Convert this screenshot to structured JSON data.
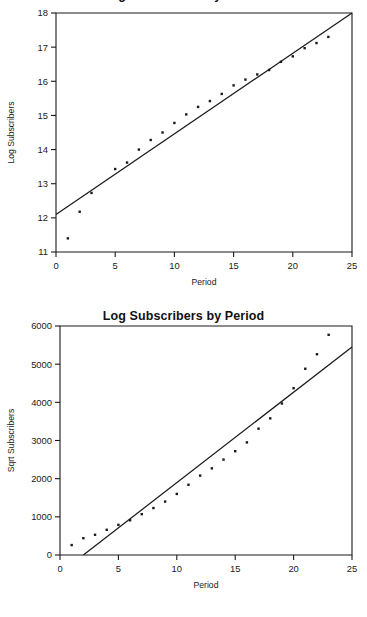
{
  "page": {
    "background": "#ffffff",
    "ink": "#1a1a1a",
    "width": 367,
    "height": 617
  },
  "charts": [
    {
      "id": "chart-1",
      "title": "Log Subscribers by Period",
      "title_clipped": true,
      "xlabel": "Period",
      "ylabel": "Log Subscribers",
      "xticks": [
        0,
        5,
        10,
        15,
        20,
        25
      ],
      "yticks": [
        11,
        12,
        13,
        14,
        15,
        16,
        17,
        18
      ],
      "xlim": [
        0,
        25
      ],
      "ylim": [
        11,
        18
      ],
      "grid": false,
      "legend": "none",
      "fit_line": {
        "intercept": 12.1,
        "slope": 0.236
      }
    },
    {
      "id": "chart-2",
      "title": "Log Subscribers by Period",
      "title_clipped": false,
      "xlabel": "Period",
      "ylabel": "Sqrt Subscribers",
      "xticks": [
        0,
        5,
        10,
        15,
        20,
        25
      ],
      "yticks": [
        0,
        1000,
        2000,
        3000,
        4000,
        5000,
        6000
      ],
      "xlim": [
        0,
        25
      ],
      "ylim": [
        0,
        6000
      ],
      "grid": false,
      "legend": "none",
      "fit_line": {
        "intercept": -470,
        "slope": 237
      }
    }
  ],
  "chart_data": [
    {
      "type": "scatter",
      "title": "Log Subscribers by Period",
      "subtitle": "",
      "xlabel": "Period",
      "ylabel": "Log Subscribers",
      "xlim": [
        0,
        25
      ],
      "ylim": [
        11,
        18
      ],
      "xticks": [
        0,
        5,
        10,
        15,
        20,
        25
      ],
      "yticks": [
        11,
        12,
        13,
        14,
        15,
        16,
        17,
        18
      ],
      "grid": false,
      "legend_position": "none",
      "annotations": [
        "fitted regression line through the scatter"
      ],
      "series": [
        {
          "name": "Log Subscribers",
          "marker": "small square dot",
          "x": [
            1,
            2,
            3,
            5,
            6,
            7,
            8,
            9,
            10,
            11,
            12,
            13,
            14,
            15,
            16,
            17,
            18,
            19,
            20,
            21,
            22,
            23
          ],
          "y": [
            11.4,
            12.18,
            12.73,
            13.43,
            13.62,
            14.0,
            14.28,
            14.5,
            14.78,
            15.03,
            15.25,
            15.42,
            15.63,
            15.88,
            16.05,
            16.2,
            16.33,
            16.57,
            16.73,
            16.97,
            17.12,
            17.3
          ]
        },
        {
          "name": "Fitted line",
          "type": "line",
          "x": [
            0,
            25
          ],
          "y": [
            12.1,
            18.0
          ]
        }
      ]
    },
    {
      "type": "scatter",
      "title": "Log Subscribers by Period",
      "subtitle": "",
      "xlabel": "Period",
      "ylabel": "Sqrt Subscribers",
      "xlim": [
        0,
        25
      ],
      "ylim": [
        0,
        6000
      ],
      "xticks": [
        0,
        5,
        10,
        15,
        20,
        25
      ],
      "yticks": [
        0,
        1000,
        2000,
        3000,
        4000,
        5000,
        6000
      ],
      "grid": false,
      "legend_position": "none",
      "annotations": [
        "fitted regression line through the scatter"
      ],
      "series": [
        {
          "name": "Sqrt Subscribers",
          "marker": "small square dot",
          "x": [
            1,
            2,
            3,
            4,
            5,
            6,
            7,
            8,
            9,
            10,
            11,
            12,
            13,
            14,
            15,
            16,
            17,
            18,
            19,
            20,
            21,
            22,
            23
          ],
          "y": [
            260,
            440,
            530,
            660,
            790,
            910,
            1070,
            1230,
            1400,
            1600,
            1840,
            2080,
            2270,
            2500,
            2720,
            2950,
            3310,
            3580,
            3970,
            4370,
            4880,
            5260,
            5770
          ]
        },
        {
          "name": "Fitted line",
          "type": "line",
          "x": [
            2,
            25
          ],
          "y": [
            0,
            5450
          ]
        }
      ]
    }
  ]
}
